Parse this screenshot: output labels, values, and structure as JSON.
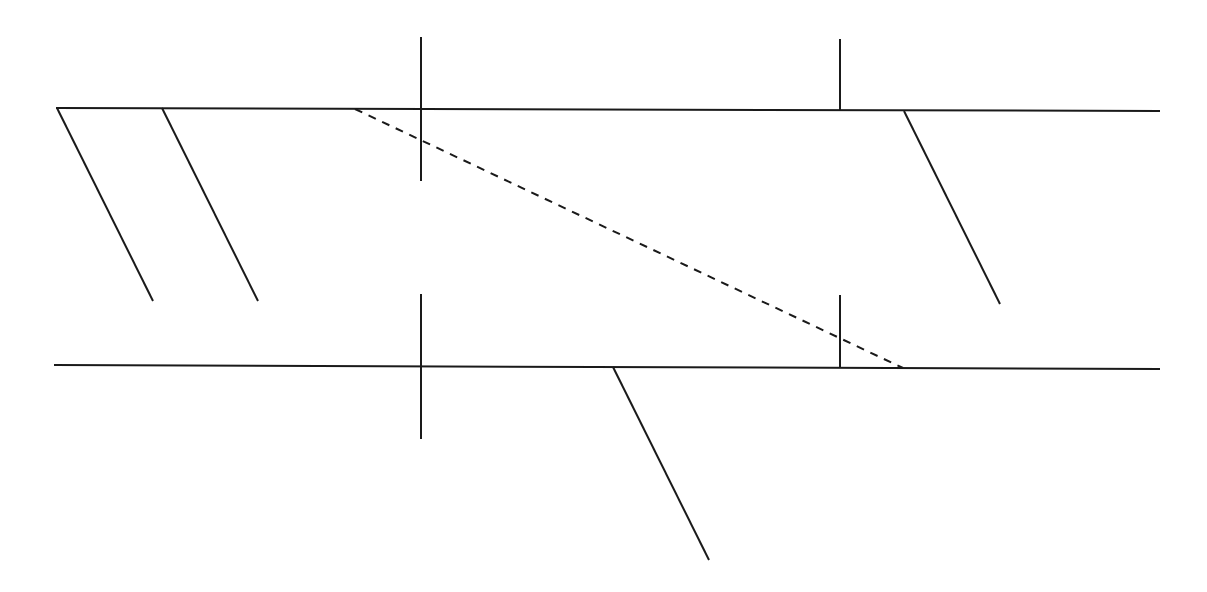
{
  "diagram": {
    "width": 1207,
    "height": 592,
    "background": "#ffffff",
    "stroke_color": "#1a1a1a",
    "stroke_width": 2,
    "dash_pattern": "8,7",
    "horizontal_lines": [
      {
        "name": "top-horizontal-line",
        "x1": 56,
        "y1": 108,
        "x2": 1160,
        "y2": 111
      },
      {
        "name": "bottom-horizontal-line",
        "x1": 54,
        "y1": 365,
        "x2": 1160,
        "y2": 369
      }
    ],
    "vertical_markers": [
      {
        "name": "top-left-vertical-marker",
        "x1": 421,
        "y1": 37,
        "x2": 421,
        "y2": 181
      },
      {
        "name": "top-right-vertical-marker",
        "x1": 840,
        "y1": 39,
        "x2": 840,
        "y2": 110
      },
      {
        "name": "bottom-left-vertical-marker",
        "x1": 421,
        "y1": 294,
        "x2": 421,
        "y2": 439
      },
      {
        "name": "bottom-right-vertical-marker",
        "x1": 840,
        "y1": 295,
        "x2": 840,
        "y2": 368
      }
    ],
    "slanted_branches": [
      {
        "name": "top-branch-1",
        "x1": 57,
        "y1": 108,
        "x2": 153,
        "y2": 301
      },
      {
        "name": "top-branch-2",
        "x1": 162,
        "y1": 108,
        "x2": 258,
        "y2": 301
      },
      {
        "name": "top-branch-3",
        "x1": 904,
        "y1": 111,
        "x2": 1000,
        "y2": 304
      },
      {
        "name": "bottom-branch-1",
        "x1": 613,
        "y1": 367,
        "x2": 709,
        "y2": 560
      }
    ],
    "dashed_lines": [
      {
        "name": "dashed-diagonal-line",
        "x1": 355,
        "y1": 109,
        "x2": 903,
        "y2": 368
      }
    ]
  }
}
